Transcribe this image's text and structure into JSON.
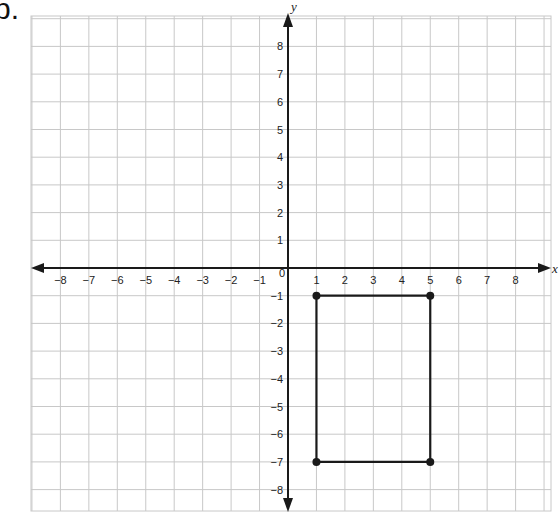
{
  "problem": {
    "label": "b."
  },
  "graph": {
    "x_axis_label": "x",
    "y_axis_label": "y",
    "x_range": [
      -8,
      8
    ],
    "y_range": [
      -8,
      8
    ],
    "origin_label": "0",
    "x_ticks": [
      "-8",
      "-7",
      "-6",
      "-5",
      "-4",
      "-3",
      "-2",
      "-1",
      "1",
      "2",
      "3",
      "4",
      "5",
      "6",
      "7",
      "8"
    ],
    "y_ticks": [
      "8",
      "7",
      "6",
      "5",
      "4",
      "3",
      "2",
      "1",
      "-1",
      "-2",
      "-3",
      "-4",
      "-5",
      "-6",
      "-7",
      "-8"
    ],
    "grid": true,
    "colors": {
      "grid": "#c8c8c8",
      "axis": "#1a1a1a",
      "shape": "#1a1a1a"
    }
  },
  "shape": {
    "type": "rectangle",
    "vertices": [
      [
        1,
        -1
      ],
      [
        5,
        -1
      ],
      [
        5,
        -7
      ],
      [
        1,
        -7
      ]
    ]
  }
}
